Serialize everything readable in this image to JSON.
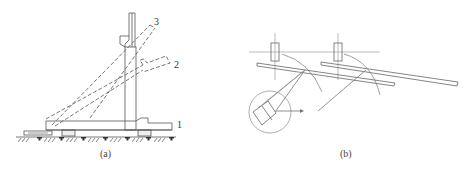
{
  "figure_a": {
    "caption": "(a)",
    "labels": {
      "1": "1",
      "2": "2",
      "3": "3"
    }
  },
  "figure_b": {
    "caption": "(b)"
  },
  "colors": {
    "line": "#555555",
    "light_line": "#999999",
    "background": "#ffffff"
  }
}
